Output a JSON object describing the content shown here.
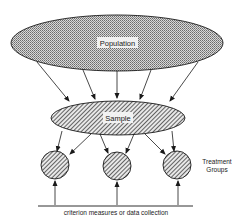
{
  "diagram": {
    "population_label": "Population",
    "sample_label": "Sample",
    "treatment_label_line1": "Treatment",
    "treatment_label_line2": "Groups",
    "bottom_label": "criterion measures or data collection",
    "colors": {
      "stroke": "#1a1a1a",
      "population_fill": "#a8a8a8",
      "sample_fill": "#8a8a8a",
      "background": "#ffffff"
    },
    "nodes": [
      {
        "id": "population",
        "shape": "ellipse",
        "label": "Population"
      },
      {
        "id": "sample",
        "shape": "ellipse",
        "label": "Sample"
      },
      {
        "id": "group-1",
        "shape": "circle"
      },
      {
        "id": "group-2",
        "shape": "circle"
      },
      {
        "id": "group-3",
        "shape": "circle"
      }
    ],
    "edges": [
      {
        "from": "population",
        "to": "sample",
        "count": 5
      },
      {
        "from": "sample",
        "to": "group-1",
        "count": 2
      },
      {
        "from": "sample",
        "to": "group-2",
        "count": 2
      },
      {
        "from": "sample",
        "to": "group-3",
        "count": 2
      },
      {
        "from": "criterion-line",
        "to": "group-1"
      },
      {
        "from": "criterion-line",
        "to": "group-2"
      },
      {
        "from": "criterion-line",
        "to": "group-3"
      }
    ]
  }
}
